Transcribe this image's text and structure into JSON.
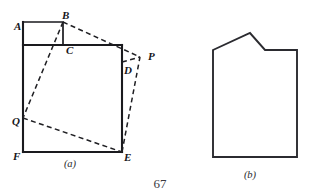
{
  "page": {
    "number": "67",
    "background": "#ffffff",
    "ink_color": "#1a1a1e"
  },
  "figures": [
    {
      "id": "figure-a",
      "caption": "(a)",
      "description": "Folded-paper geometry figure: rectangle ABCF with small square at top-left and dashed fold lines to points P and Q",
      "labels": [
        {
          "name": "A",
          "text": "A",
          "x": 14,
          "y": 30
        },
        {
          "name": "B",
          "text": "B",
          "x": 62,
          "y": 19
        },
        {
          "name": "C",
          "text": "C",
          "x": 66,
          "y": 54
        },
        {
          "name": "D",
          "text": "D",
          "x": 124,
          "y": 74
        },
        {
          "name": "P",
          "text": "P",
          "x": 148,
          "y": 60
        },
        {
          "name": "Q",
          "text": "Q",
          "x": 12,
          "y": 125
        },
        {
          "name": "F",
          "text": "F",
          "x": 13,
          "y": 160
        },
        {
          "name": "E",
          "text": "E",
          "x": 124,
          "y": 161
        }
      ],
      "points": {
        "A": [
          23,
          22
        ],
        "B": [
          63,
          22
        ],
        "C": [
          63,
          45
        ],
        "D": [
          122,
          64
        ],
        "P": [
          140,
          57
        ],
        "Q": [
          23,
          118
        ],
        "F": [
          23,
          152
        ],
        "E": [
          122,
          152
        ]
      },
      "solid_paths": [
        "M 23 22 L 63 22 L 63 45",
        "M 23 22 L 23 152",
        "M 23 45 L 122 45",
        "M 122 45 L 122 152",
        "M 23 152 L 122 152"
      ],
      "dashed_paths": [
        "M 63 22 L 140 57",
        "M 63 22 L 23 118",
        "M 23 118 L 122 152",
        "M 122 152 L 140 57",
        "M 122 62 L 140 57"
      ],
      "caption_pos": [
        70,
        167
      ]
    },
    {
      "id": "figure-b",
      "caption": "(b)",
      "description": "Hexagonal house-like outline with asymmetric peaked roof",
      "outline": "M 213 50 L 250 33 L 265 50 L 297 50 L 297 157 L 213 157 Z",
      "vertices": [
        [
          213,
          50
        ],
        [
          250,
          33
        ],
        [
          265,
          50
        ],
        [
          297,
          50
        ],
        [
          297,
          157
        ],
        [
          213,
          157
        ]
      ],
      "caption_pos": [
        250,
        178
      ]
    }
  ],
  "page_number_pos": [
    160,
    188
  ]
}
